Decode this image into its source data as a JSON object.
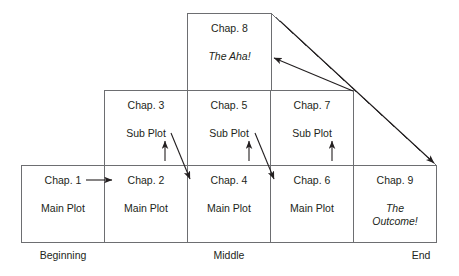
{
  "diagram": {
    "type": "story-structure-pyramid",
    "colors": {
      "stroke": "#6d6e71",
      "arrow": "#231f20",
      "text": "#231f20",
      "background": "#ffffff"
    },
    "rows": {
      "top": {
        "cells": [
          {
            "title": "Chap. 8",
            "subtitle": "The Aha!",
            "italic": true
          }
        ]
      },
      "middle": {
        "cells": [
          {
            "title": "Chap. 3",
            "subtitle": "Sub Plot",
            "italic": false
          },
          {
            "title": "Chap. 5",
            "subtitle": "Sub Plot",
            "italic": false
          },
          {
            "title": "Chap. 7",
            "subtitle": "Sub Plot",
            "italic": false
          }
        ]
      },
      "bottom": {
        "cells": [
          {
            "title": "Chap. 1",
            "subtitle": "Main Plot",
            "italic": false
          },
          {
            "title": "Chap. 2",
            "subtitle": "Main Plot",
            "italic": false
          },
          {
            "title": "Chap. 4",
            "subtitle": "Main Plot",
            "italic": false
          },
          {
            "title": "Chap. 6",
            "subtitle": "Main Plot",
            "italic": false
          },
          {
            "title": "Chap. 9",
            "subtitle": "The Outcome!",
            "italic": true
          }
        ]
      }
    },
    "axis_labels": [
      {
        "text": "Beginning"
      },
      {
        "text": "Middle"
      },
      {
        "text": "End"
      }
    ]
  }
}
